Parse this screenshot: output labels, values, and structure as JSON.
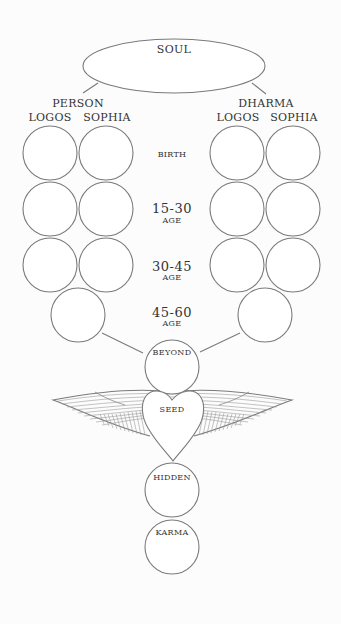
{
  "diagram": {
    "top": {
      "soul": "SOUL"
    },
    "branches": {
      "left": {
        "title": "PERSON",
        "col1": "LOGOS",
        "col2": "SOPHIA"
      },
      "right": {
        "title": "DHARMA",
        "col1": "LOGOS",
        "col2": "SOPHIA"
      }
    },
    "stages": [
      {
        "label": "BIRTH"
      },
      {
        "label": "15-30",
        "sub": "AGE"
      },
      {
        "label": "30-45",
        "sub": "AGE"
      },
      {
        "label": "45-60",
        "sub": "AGE"
      }
    ],
    "center_chain": {
      "beyond": "BEYOND",
      "seed": "SEED",
      "hidden": "HIDDEN",
      "karma": "KARMA"
    },
    "colors": {
      "background": "#fcfcfc",
      "stroke": "#7a7a7a",
      "text": "#333333"
    }
  }
}
